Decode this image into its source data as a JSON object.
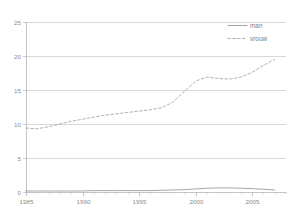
{
  "chart_data": {
    "type": "line",
    "title": "",
    "subtitle": "",
    "xlabel": "",
    "ylabel": "",
    "xlim": [
      1985,
      2008
    ],
    "ylim": [
      0,
      25
    ],
    "grid": true,
    "legend_position": "top-right",
    "x": [
      1985,
      1986,
      1987,
      1988,
      1989,
      1990,
      1991,
      1992,
      1993,
      1994,
      1995,
      1996,
      1997,
      1998,
      1999,
      2000,
      2001,
      2002,
      2003,
      2004,
      2005,
      2006,
      2007
    ],
    "x_tick_labels": [
      "1985",
      "1990",
      "1995",
      "2000",
      "2005"
    ],
    "x_ticks": [
      1985,
      1990,
      1995,
      2000,
      2005
    ],
    "y_ticks": [
      0,
      5,
      10,
      15,
      20,
      25
    ],
    "y_tick_labels": [
      "0",
      "5",
      "10",
      "15",
      "20",
      "25"
    ],
    "series": [
      {
        "name": "man",
        "style": "solid",
        "color": "#9a9a9a",
        "values": [
          0.15,
          0.15,
          0.15,
          0.15,
          0.15,
          0.15,
          0.2,
          0.2,
          0.2,
          0.2,
          0.2,
          0.2,
          0.25,
          0.3,
          0.35,
          0.45,
          0.55,
          0.6,
          0.6,
          0.55,
          0.5,
          0.4,
          0.3
        ]
      },
      {
        "name": "vrouw",
        "style": "dashed",
        "color": "#a8a8a8",
        "values": [
          9.4,
          9.3,
          9.6,
          10.0,
          10.4,
          10.7,
          11.0,
          11.3,
          11.5,
          11.7,
          11.9,
          12.1,
          12.4,
          13.2,
          14.8,
          16.3,
          16.9,
          16.7,
          16.6,
          16.9,
          17.6,
          18.6,
          19.5
        ]
      }
    ]
  },
  "legend": {
    "items": [
      {
        "label": "man"
      },
      {
        "label": "vrouw"
      }
    ]
  }
}
